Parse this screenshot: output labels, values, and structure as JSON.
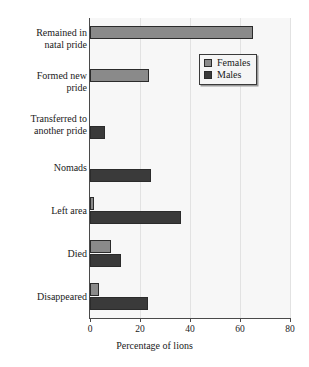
{
  "chart_data": {
    "type": "bar",
    "orientation": "horizontal",
    "title": "",
    "xlabel": "Percentage of lions",
    "ylabel": "",
    "xlim": [
      0,
      80
    ],
    "xticks": [
      0,
      20,
      40,
      60,
      80
    ],
    "xticklabels": [
      "0",
      "20",
      "40",
      "60",
      "80"
    ],
    "grid": true,
    "grid_axis": "x",
    "legend_position": "upper right",
    "categories": [
      "Remained in\nnatal pride",
      "Formed new\npride",
      "Transferred to\nanother pride",
      "Nomads",
      "Left area",
      "Died",
      "Disappeared"
    ],
    "category_labels": [
      {
        "line1": "Remained in",
        "line2": "natal pride"
      },
      {
        "line1": "Formed new",
        "line2": "pride"
      },
      {
        "line1": "Transferred to",
        "line2": "another pride"
      },
      {
        "line1": "Nomads",
        "line2": ""
      },
      {
        "line1": "Left area",
        "line2": ""
      },
      {
        "line1": "Died",
        "line2": ""
      },
      {
        "line1": "Disappeared",
        "line2": ""
      }
    ],
    "series": [
      {
        "name": "Females",
        "color": "#8a8a8a",
        "values": [
          65,
          23.5,
          0,
          0,
          1.5,
          8.5,
          3.5
        ]
      },
      {
        "name": "Males",
        "color": "#3a3a3a",
        "values": [
          0,
          0,
          6,
          24.5,
          36.5,
          12.5,
          23
        ]
      }
    ]
  },
  "legend": {
    "items": [
      {
        "label": "Females",
        "color": "#8a8a8a"
      },
      {
        "label": "Males",
        "color": "#3a3a3a"
      }
    ]
  },
  "axis": {
    "xlabel": "Percentage of lions",
    "ticklabels": [
      "0",
      "20",
      "40",
      "60",
      "80"
    ]
  }
}
